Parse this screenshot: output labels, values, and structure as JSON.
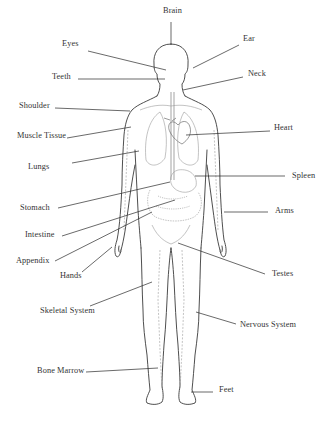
{
  "diagram": {
    "type": "human-body-anatomy",
    "labels": [
      {
        "id": "brain",
        "text": "Brain",
        "x": 163,
        "y": 14,
        "anchor": "middle",
        "line": [
          171,
          22,
          171,
          45
        ]
      },
      {
        "id": "eyes",
        "text": "Eyes",
        "x": 62,
        "y": 47,
        "anchor": "start",
        "line": [
          88,
          51,
          166,
          70
        ]
      },
      {
        "id": "ear",
        "text": "Ear",
        "x": 243,
        "y": 42,
        "anchor": "start",
        "line": [
          239,
          45,
          193,
          68
        ]
      },
      {
        "id": "teeth",
        "text": "Teeth",
        "x": 52,
        "y": 80,
        "anchor": "start",
        "line": [
          78,
          79,
          165,
          79
        ]
      },
      {
        "id": "neck",
        "text": "Neck",
        "x": 248,
        "y": 77,
        "anchor": "start",
        "line": [
          243,
          77,
          183,
          90
        ]
      },
      {
        "id": "shoulder",
        "text": "Shoulder",
        "x": 19,
        "y": 109,
        "anchor": "start",
        "line": [
          55,
          108,
          130,
          111
        ]
      },
      {
        "id": "muscle-tissue",
        "text": "Muscle Tissue",
        "x": 17,
        "y": 139,
        "anchor": "start",
        "line": [
          67,
          138,
          131,
          127
        ]
      },
      {
        "id": "heart",
        "text": "Heart",
        "x": 274,
        "y": 131,
        "anchor": "start",
        "line": [
          270,
          131,
          186,
          135
        ]
      },
      {
        "id": "lungs",
        "text": "Lungs",
        "x": 28,
        "y": 170,
        "anchor": "start",
        "line": [
          72,
          163,
          139,
          151
        ]
      },
      {
        "id": "spleen",
        "text": "Spleen",
        "x": 292,
        "y": 179,
        "anchor": "start",
        "line": [
          285,
          176,
          195,
          176
        ]
      },
      {
        "id": "stomach",
        "text": "Stomach",
        "x": 20,
        "y": 211,
        "anchor": "start",
        "line": [
          58,
          208,
          170,
          182
        ]
      },
      {
        "id": "arms",
        "text": "Arms",
        "x": 275,
        "y": 214,
        "anchor": "start",
        "line": [
          268,
          212,
          224,
          212
        ]
      },
      {
        "id": "intestine",
        "text": "Intestine",
        "x": 25,
        "y": 238,
        "anchor": "start",
        "line": [
          62,
          236,
          175,
          200
        ]
      },
      {
        "id": "appendix",
        "text": "Appendix",
        "x": 16,
        "y": 264,
        "anchor": "start",
        "line": [
          55,
          261,
          152,
          212
        ]
      },
      {
        "id": "hands",
        "text": "Hands",
        "x": 60,
        "y": 279,
        "anchor": "start",
        "line": [
          82,
          272,
          112,
          247
        ]
      },
      {
        "id": "testes",
        "text": "Testes",
        "x": 272,
        "y": 277,
        "anchor": "start",
        "line": [
          265,
          274,
          178,
          243
        ]
      },
      {
        "id": "skeletal-system",
        "text": "Skeletal System",
        "x": 40,
        "y": 314,
        "anchor": "start",
        "line": [
          90,
          306,
          152,
          282
        ]
      },
      {
        "id": "nervous-system",
        "text": "Nervous System",
        "x": 240,
        "y": 328,
        "anchor": "start",
        "line": [
          236,
          324,
          196,
          312
        ]
      },
      {
        "id": "bone-marrow",
        "text": "Bone Marrow",
        "x": 37,
        "y": 374,
        "anchor": "start",
        "line": [
          86,
          372,
          158,
          368
        ]
      },
      {
        "id": "feet",
        "text": "Feet",
        "x": 219,
        "y": 393,
        "anchor": "start",
        "line": [
          213,
          392,
          191,
          392
        ]
      }
    ],
    "colors": {
      "outline": "#3a3a3a",
      "leader": "#2a2a2a",
      "organs": "#9a9a9a",
      "text": "#333333",
      "background": "#ffffff"
    }
  }
}
